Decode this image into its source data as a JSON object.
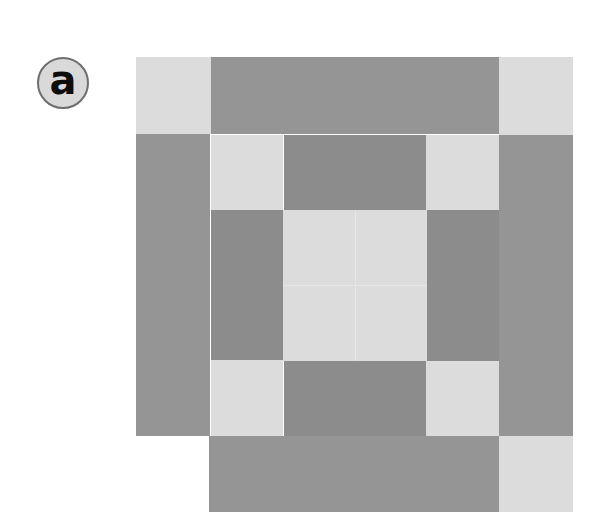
{
  "panel_label": "a",
  "colors": {
    "light": "#dcdcdc",
    "dark": "#959595",
    "darker": "#8c8c8c",
    "label_fill": "#d9d9d9",
    "label_border": "#6e6e6e"
  },
  "blocks": [
    {
      "name": "outer-top-left-light",
      "x": 136,
      "y": 57,
      "w": 75,
      "h": 77,
      "tone": "light"
    },
    {
      "name": "outer-top-bar-dark",
      "x": 211,
      "y": 57,
      "w": 288,
      "h": 77,
      "tone": "dark"
    },
    {
      "name": "outer-top-right-light",
      "x": 499,
      "y": 57,
      "w": 74,
      "h": 78,
      "tone": "light"
    },
    {
      "name": "outer-left-bar-dark",
      "x": 136,
      "y": 134,
      "w": 74,
      "h": 302,
      "tone": "dark"
    },
    {
      "name": "outer-right-bar-dark",
      "x": 499,
      "y": 135,
      "w": 74,
      "h": 301,
      "tone": "dark"
    },
    {
      "name": "outer-bottom-bar-dark",
      "x": 209,
      "y": 436,
      "w": 290,
      "h": 76,
      "tone": "dark"
    },
    {
      "name": "outer-bottom-right-light",
      "x": 499,
      "y": 436,
      "w": 74,
      "h": 76,
      "tone": "light"
    },
    {
      "name": "inner-top-left-light",
      "x": 211,
      "y": 135,
      "w": 72,
      "h": 75,
      "tone": "light"
    },
    {
      "name": "inner-top-bar-dark",
      "x": 284,
      "y": 135,
      "w": 142,
      "h": 75,
      "tone": "darker"
    },
    {
      "name": "inner-top-right-light",
      "x": 426,
      "y": 135,
      "w": 73,
      "h": 75,
      "tone": "light"
    },
    {
      "name": "inner-left-bar-dark",
      "x": 211,
      "y": 210,
      "w": 72,
      "h": 150,
      "tone": "darker"
    },
    {
      "name": "center-square-light",
      "x": 283,
      "y": 210,
      "w": 144,
      "h": 151,
      "tone": "light"
    },
    {
      "name": "inner-right-bar-dark",
      "x": 427,
      "y": 210,
      "w": 72,
      "h": 151,
      "tone": "darker"
    },
    {
      "name": "inner-bottom-left-light",
      "x": 211,
      "y": 360,
      "w": 72,
      "h": 76,
      "tone": "light"
    },
    {
      "name": "inner-bottom-bar-dark",
      "x": 284,
      "y": 361,
      "w": 142,
      "h": 75,
      "tone": "darker"
    },
    {
      "name": "inner-bottom-right-light",
      "x": 426,
      "y": 361,
      "w": 73,
      "h": 75,
      "tone": "light"
    }
  ],
  "center_seams": {
    "vertical_x": 355,
    "horizontal_y": 285
  }
}
